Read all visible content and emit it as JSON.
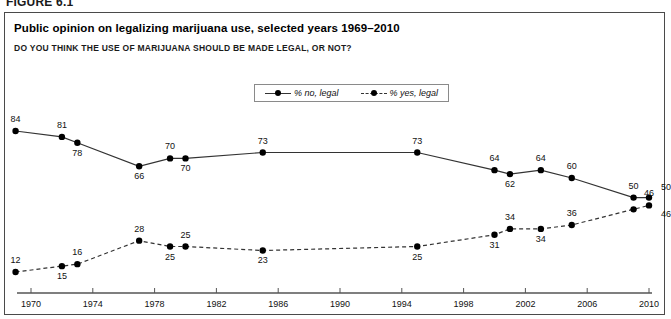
{
  "figure": {
    "label": "FIGURE 6.1",
    "title": "Public opinion on legalizing marijuana use, selected years 1969–2010",
    "subtitle": "DO YOU THINK THE USE OF MARIJUANA SHOULD BE MADE LEGAL, OR NOT?"
  },
  "legend": {
    "position": "top-center",
    "entries": [
      {
        "label": "% no, legal",
        "style": "solid",
        "marker": "filled-circle"
      },
      {
        "label": "% yes, legal",
        "style": "dashed",
        "marker": "filled-circle"
      }
    ]
  },
  "chart_data": {
    "type": "line",
    "title": "Public opinion on legalizing marijuana use, selected years 1969–2010",
    "subtitle": "DO YOU THINK THE USE OF MARIJUANA SHOULD BE MADE LEGAL, OR NOT?",
    "xlabel": "",
    "ylabel": "",
    "xlim": [
      1968,
      2011
    ],
    "ylim": [
      0,
      100
    ],
    "grid": false,
    "legend_position": "top-center",
    "xticks": [
      1970,
      1974,
      1978,
      1982,
      1986,
      1990,
      1994,
      1998,
      2002,
      2006,
      2010
    ],
    "xticklabels": [
      "1970",
      "1974",
      "1978",
      "1982",
      "1986",
      "1990",
      "1994",
      "1998",
      "2002",
      "2006",
      "2010"
    ],
    "x": [
      1969,
      1972,
      1973,
      1977,
      1979,
      1980,
      1985,
      1995,
      2000,
      2001,
      2003,
      2005,
      2009,
      2010
    ],
    "series": [
      {
        "name": "% no, legal",
        "style": "solid",
        "values": [
          84,
          81,
          78,
          66,
          70,
          70,
          73,
          73,
          64,
          62,
          64,
          60,
          50,
          50
        ],
        "labels": [
          "84",
          "81",
          "78",
          "66",
          "70",
          "70",
          "73",
          "73",
          "64",
          "62",
          "64",
          "60",
          "50",
          ""
        ]
      },
      {
        "name": "% yes, legal",
        "style": "dashed",
        "values": [
          12,
          15,
          16,
          28,
          25,
          25,
          23,
          25,
          31,
          34,
          34,
          36,
          44,
          46
        ],
        "labels": [
          "12",
          "15",
          "16",
          "28",
          "25",
          "25",
          "23",
          "25",
          "31",
          "34",
          "34",
          "36",
          "",
          "46"
        ]
      }
    ]
  },
  "colors": {
    "line": "#333333",
    "marker": "#000000",
    "axis": "#555555",
    "border": "#4a4a4a",
    "text": "#111111"
  }
}
